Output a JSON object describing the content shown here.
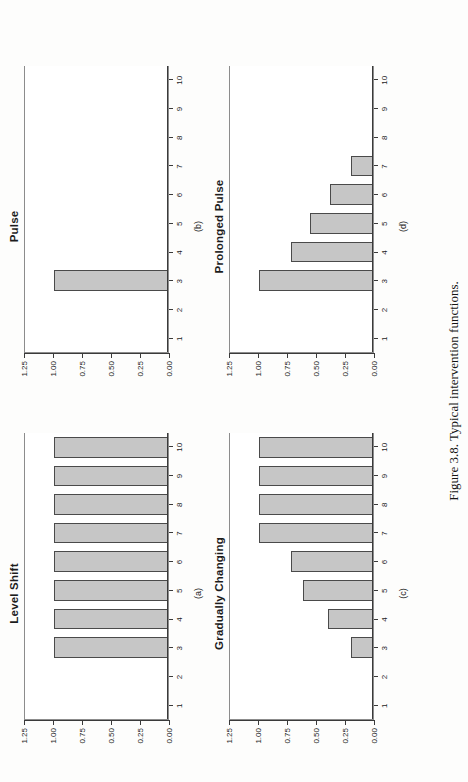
{
  "figure": {
    "caption": "Figure 3.8.  Typical intervention functions.",
    "bar_color": "#c6c6c6",
    "bar_border_color": "#4a4a4a",
    "axis_color": "#3a3a3a"
  },
  "axis": {
    "y_ticks": [
      "1.25",
      "1.00",
      "0.75",
      "0.50",
      "0.25",
      "0.00"
    ],
    "y_values": [
      1.25,
      1.0,
      0.75,
      0.5,
      0.25,
      0.0
    ],
    "x_ticks": [
      "1",
      "2",
      "3",
      "4",
      "5",
      "6",
      "7",
      "8",
      "9",
      "10"
    ],
    "ylim": [
      0,
      1.25
    ]
  },
  "panels": [
    {
      "letter": "(a)",
      "title": "Level Shift"
    },
    {
      "letter": "(b)",
      "title": "Pulse"
    },
    {
      "letter": "(c)",
      "title": "Gradually Changing"
    },
    {
      "letter": "(d)",
      "title": "Prolonged Pulse"
    }
  ],
  "chart_data": [
    {
      "type": "bar",
      "title": "Level Shift",
      "panel": "(a)",
      "categories": [
        "1",
        "2",
        "3",
        "4",
        "5",
        "6",
        "7",
        "8",
        "9",
        "10"
      ],
      "values": [
        0,
        0,
        1.0,
        1.0,
        1.0,
        1.0,
        1.0,
        1.0,
        1.0,
        1.0
      ],
      "xlabel": "",
      "ylabel": "",
      "ylim": [
        0,
        1.25
      ],
      "yticks": [
        0.0,
        0.25,
        0.5,
        0.75,
        1.0,
        1.25
      ],
      "grid": false,
      "legend": "none"
    },
    {
      "type": "bar",
      "title": "Pulse",
      "panel": "(b)",
      "categories": [
        "1",
        "2",
        "3",
        "4",
        "5",
        "6",
        "7",
        "8",
        "9",
        "10"
      ],
      "values": [
        0,
        0,
        1.0,
        0,
        0,
        0,
        0,
        0,
        0,
        0
      ],
      "xlabel": "",
      "ylabel": "",
      "ylim": [
        0,
        1.25
      ],
      "yticks": [
        0.0,
        0.25,
        0.5,
        0.75,
        1.0,
        1.25
      ],
      "grid": false,
      "legend": "none"
    },
    {
      "type": "bar",
      "title": "Gradually Changing",
      "panel": "(c)",
      "categories": [
        "1",
        "2",
        "3",
        "4",
        "5",
        "6",
        "7",
        "8",
        "9",
        "10"
      ],
      "values": [
        0,
        0,
        0.19,
        0.39,
        0.61,
        0.72,
        1.0,
        1.0,
        1.0,
        1.0
      ],
      "xlabel": "",
      "ylabel": "",
      "ylim": [
        0,
        1.25
      ],
      "yticks": [
        0.0,
        0.25,
        0.5,
        0.75,
        1.0,
        1.25
      ],
      "grid": false,
      "legend": "none"
    },
    {
      "type": "bar",
      "title": "Prolonged Pulse",
      "panel": "(d)",
      "categories": [
        "1",
        "2",
        "3",
        "4",
        "5",
        "6",
        "7",
        "8",
        "9",
        "10"
      ],
      "values": [
        0,
        0,
        1.0,
        0.72,
        0.55,
        0.38,
        0.19,
        0,
        0,
        0
      ],
      "xlabel": "",
      "ylabel": "",
      "ylim": [
        0,
        1.25
      ],
      "yticks": [
        0.0,
        0.25,
        0.5,
        0.75,
        1.0,
        1.25
      ],
      "grid": false,
      "legend": "none"
    }
  ]
}
